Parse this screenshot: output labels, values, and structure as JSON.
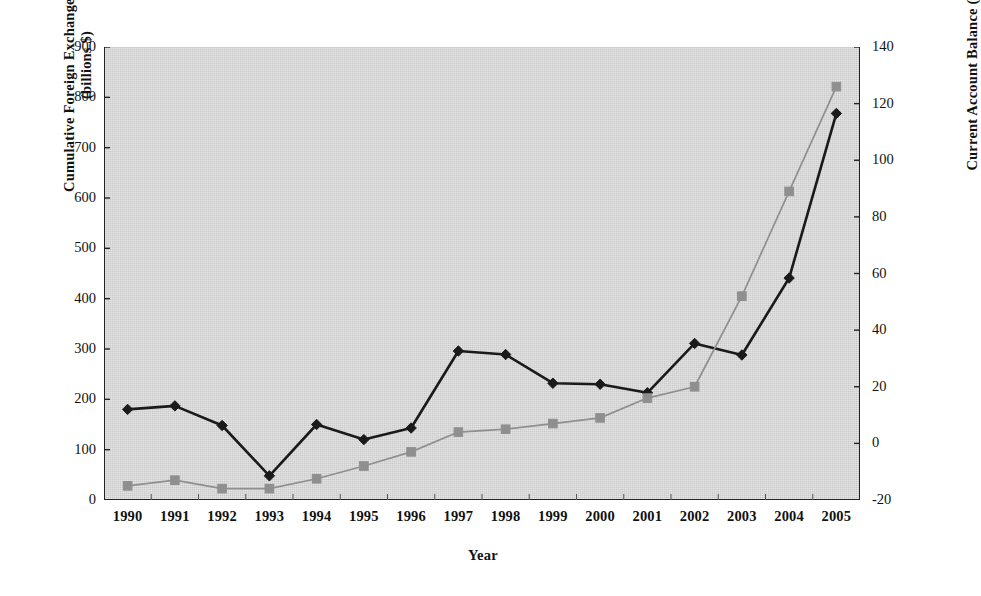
{
  "chart_data": {
    "type": "line",
    "title": "",
    "xlabel": "Year",
    "ylabel": "Cumulative Foreign Exchange Reserves (billions $)",
    "ylabel_line1": "Cumulative Foreign Exchange Reserves",
    "ylabel_line2": "(billions $)",
    "y2label": "Current Account Balance (billions $)",
    "categories": [
      "1990",
      "1991",
      "1992",
      "1993",
      "1994",
      "1995",
      "1996",
      "1997",
      "1998",
      "1999",
      "2000",
      "2001",
      "2002",
      "2003",
      "2004",
      "2005"
    ],
    "ylim": [
      0,
      900
    ],
    "y2lim": [
      -20,
      140
    ],
    "yticks": [
      0,
      100,
      200,
      300,
      400,
      500,
      600,
      700,
      800,
      900
    ],
    "y2ticks": [
      -20,
      0,
      20,
      40,
      60,
      80,
      100,
      120,
      140
    ],
    "grid": false,
    "legend": "none",
    "plot_background": "#c9c9c9",
    "series": [
      {
        "name": "Cumulative Foreign Exchange Reserves",
        "axis": "left",
        "color": "#1a1a1a",
        "marker": "diamond",
        "values": [
          180,
          187,
          148,
          48,
          150,
          120,
          143,
          296,
          289,
          232,
          230,
          213,
          311,
          288,
          441,
          768
        ]
      },
      {
        "name": "Current Account Balance",
        "axis": "right",
        "color": "#8f8f8f",
        "marker": "square",
        "values": [
          -15,
          -13,
          -16,
          -16,
          -12.5,
          -8,
          -3,
          4,
          5,
          7,
          9,
          16,
          20,
          52,
          89,
          126
        ]
      }
    ]
  }
}
